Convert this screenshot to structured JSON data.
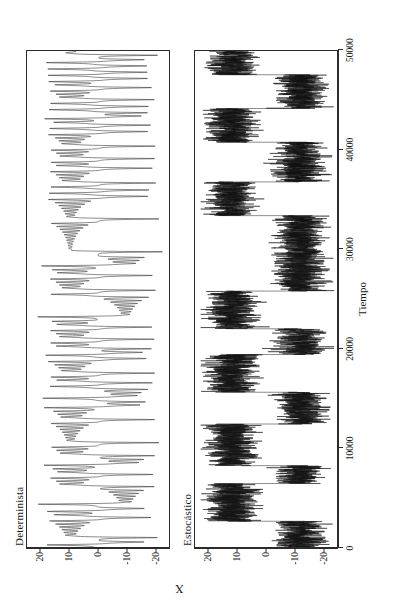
{
  "figure": {
    "y_axis_label": "X",
    "x_axis_label": "Tiempo",
    "panels": [
      {
        "key": "det",
        "title": "Determinista"
      },
      {
        "key": "est",
        "title": "Estocástico"
      }
    ],
    "x_ticks": [
      "0",
      "10000",
      "20000",
      "30000",
      "40000",
      "50000"
    ],
    "y_ticks": [
      "20",
      "10",
      "0",
      "-10",
      "-20"
    ]
  },
  "chart_data": {
    "type": "line",
    "title": "",
    "xlabel": "Tiempo",
    "ylabel": "X",
    "xlim": [
      0,
      50000
    ],
    "ylim": [
      -25,
      25
    ],
    "grid": false,
    "legend": "none",
    "x_ticks": [
      0,
      10000,
      20000,
      30000,
      40000,
      50000
    ],
    "y_ticks": [
      20,
      10,
      0,
      -10,
      -20
    ],
    "panels": [
      {
        "name": "Determinista",
        "description": "Serie temporal caótica determinista con oscilaciones rápidas alternando entre dos lóbulos centrados cerca de +10 y -10, con excursiones hasta ±20.",
        "amplitude_envelope": 18,
        "lobe_centers": [
          10,
          -10
        ],
        "regime_switches_x": [
          1200,
          3400,
          5900,
          8200,
          10500,
          12900,
          15200,
          17800,
          20100,
          22600,
          25000,
          27400,
          29900,
          32300,
          34800,
          37200,
          39600,
          42100,
          44500,
          47000,
          49200
        ],
        "samples_per_unit": 1
      },
      {
        "name": "Estocástico",
        "description": "Serie temporal estocástica con conmutación de régimen: permanece en bandas ruidosas densas alrededor de +12 o -12 durante intervalos prolongados, con saltos abruptos entre ellas.",
        "amplitude_envelope": 22,
        "lobe_centers": [
          12,
          -12
        ],
        "noise_band": 9,
        "regime_segments": [
          {
            "start": 0,
            "end": 2600,
            "level": -12
          },
          {
            "start": 2600,
            "end": 6400,
            "level": 12
          },
          {
            "start": 6400,
            "end": 8200,
            "level": -12
          },
          {
            "start": 8200,
            "end": 12400,
            "level": 12
          },
          {
            "start": 12400,
            "end": 15600,
            "level": -12
          },
          {
            "start": 15600,
            "end": 19400,
            "level": 12
          },
          {
            "start": 19400,
            "end": 22000,
            "level": -12
          },
          {
            "start": 22000,
            "end": 25800,
            "level": 12
          },
          {
            "start": 25800,
            "end": 27400,
            "level": -12
          },
          {
            "start": 27400,
            "end": 33400,
            "level": -12
          },
          {
            "start": 33400,
            "end": 36800,
            "level": 12
          },
          {
            "start": 36800,
            "end": 40800,
            "level": -12
          },
          {
            "start": 40800,
            "end": 44200,
            "level": 12
          },
          {
            "start": 44200,
            "end": 47600,
            "level": -12
          },
          {
            "start": 47600,
            "end": 50000,
            "level": 12
          }
        ]
      }
    ]
  }
}
